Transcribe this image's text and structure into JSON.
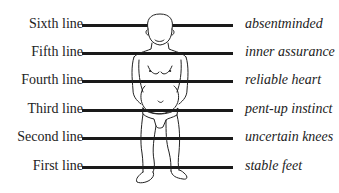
{
  "diagram": {
    "rows": [
      {
        "label": "Sixth line",
        "description": "absentminded",
        "y": 25
      },
      {
        "label": "Fifth line",
        "description": "inner assurance",
        "y": 53
      },
      {
        "label": "Fourth line",
        "description": "reliable heart",
        "y": 81
      },
      {
        "label": "Third line",
        "description": "pent-up instinct",
        "y": 110
      },
      {
        "label": "Second line",
        "description": "uncertain knees",
        "y": 138
      },
      {
        "label": "First line",
        "description": "stable feet",
        "y": 167
      }
    ],
    "figure": {
      "icon": "standing-human-figure-icon"
    },
    "colors": {
      "line": "#1a1a1a",
      "text": "#222222",
      "background": "#ffffff"
    }
  }
}
